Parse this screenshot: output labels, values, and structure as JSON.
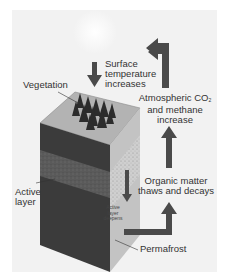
{
  "diagram": {
    "labels": {
      "vegetation": "Vegetation",
      "surface_temp_line1": "Surface",
      "surface_temp_line2": "temperature",
      "surface_temp_line3": "increases",
      "atmos_line1": "Atmospheric CO",
      "atmos_sub": "2",
      "atmos_line2": "and methane",
      "atmos_line3": "increase",
      "organic_line1": "Organic matter",
      "organic_line2": "thaws and decays",
      "active_layer_line1": "Active",
      "active_layer_line2": "layer",
      "deepens_line1": "Active",
      "deepens_line2": "layer",
      "deepens_line3": "deepens",
      "permafrost": "Permafrost"
    },
    "colors": {
      "background": "#f2f2f2",
      "sun": "#fafafa",
      "arrow": "#4a4a4a",
      "block_top": "#b5b5b5",
      "block_front_dark": "#3a3a3a",
      "block_front_active": "#5e5e5e",
      "block_side": "#c4c4c4",
      "block_side_speckle": "#d8d8d8",
      "vegetation": "#2e2e2e"
    }
  }
}
